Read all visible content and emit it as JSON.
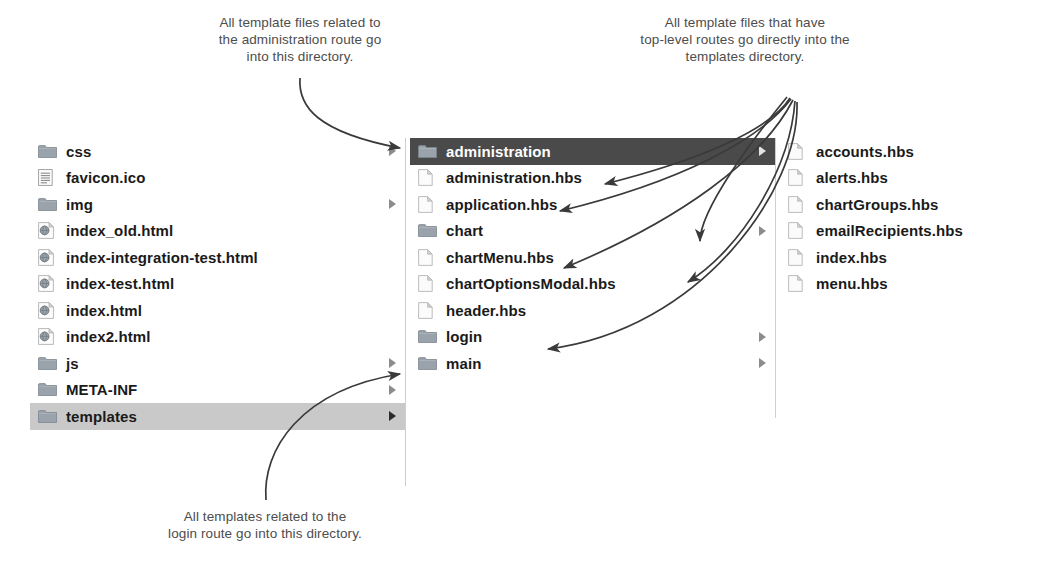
{
  "callouts": {
    "administration": "All template files related to\nthe administration route go\ninto this directory.",
    "top_level": "All template files that have\ntop-level routes go directly into the\ntemplates directory.",
    "login": "All templates related to the\nlogin route go into this directory."
  },
  "colors": {
    "selected_dark_bg": "#4a4a4a",
    "selected_light_bg": "#c9c9c9",
    "folder_icon": "#9aa3ab",
    "file_icon": "#e8e8e8",
    "text": "#1a1a1a",
    "callout_text": "#4d4d4d",
    "divider": "#cfcfcf",
    "arrow": "#3a3a3a"
  },
  "columns": [
    {
      "name": "project-root-column",
      "items": [
        {
          "label": "css",
          "icon": "folder-icon",
          "chevron": true,
          "selected": "none"
        },
        {
          "label": "favicon.ico",
          "icon": "document-icon",
          "chevron": false,
          "selected": "none"
        },
        {
          "label": "img",
          "icon": "folder-icon",
          "chevron": true,
          "selected": "none"
        },
        {
          "label": "index_old.html",
          "icon": "html-icon",
          "chevron": false,
          "selected": "none"
        },
        {
          "label": "index-integration-test.html",
          "icon": "html-icon",
          "chevron": false,
          "selected": "none"
        },
        {
          "label": "index-test.html",
          "icon": "html-icon",
          "chevron": false,
          "selected": "none"
        },
        {
          "label": "index.html",
          "icon": "html-icon",
          "chevron": false,
          "selected": "none"
        },
        {
          "label": "index2.html",
          "icon": "html-icon",
          "chevron": false,
          "selected": "none"
        },
        {
          "label": "js",
          "icon": "folder-icon",
          "chevron": true,
          "selected": "none"
        },
        {
          "label": "META-INF",
          "icon": "folder-icon",
          "chevron": true,
          "selected": "none"
        },
        {
          "label": "templates",
          "icon": "folder-icon",
          "chevron": true,
          "selected": "light"
        }
      ]
    },
    {
      "name": "templates-column",
      "items": [
        {
          "label": "administration",
          "icon": "folder-icon",
          "chevron": true,
          "selected": "dark"
        },
        {
          "label": "administration.hbs",
          "icon": "file-icon",
          "chevron": false,
          "selected": "none"
        },
        {
          "label": "application.hbs",
          "icon": "file-icon",
          "chevron": false,
          "selected": "none"
        },
        {
          "label": "chart",
          "icon": "folder-icon",
          "chevron": true,
          "selected": "none"
        },
        {
          "label": "chartMenu.hbs",
          "icon": "file-icon",
          "chevron": false,
          "selected": "none"
        },
        {
          "label": "chartOptionsModal.hbs",
          "icon": "file-icon",
          "chevron": false,
          "selected": "none"
        },
        {
          "label": "header.hbs",
          "icon": "file-icon",
          "chevron": false,
          "selected": "none"
        },
        {
          "label": "login",
          "icon": "folder-icon",
          "chevron": true,
          "selected": "none"
        },
        {
          "label": "main",
          "icon": "folder-icon",
          "chevron": true,
          "selected": "none"
        }
      ]
    },
    {
      "name": "administration-column",
      "items": [
        {
          "label": "accounts.hbs",
          "icon": "file-icon",
          "chevron": false,
          "selected": "none"
        },
        {
          "label": "alerts.hbs",
          "icon": "file-icon",
          "chevron": false,
          "selected": "none"
        },
        {
          "label": "chartGroups.hbs",
          "icon": "file-icon",
          "chevron": false,
          "selected": "none"
        },
        {
          "label": "emailRecipients.hbs",
          "icon": "file-icon",
          "chevron": false,
          "selected": "none"
        },
        {
          "label": "index.hbs",
          "icon": "file-icon",
          "chevron": false,
          "selected": "none"
        },
        {
          "label": "menu.hbs",
          "icon": "file-icon",
          "chevron": false,
          "selected": "none"
        }
      ]
    }
  ]
}
